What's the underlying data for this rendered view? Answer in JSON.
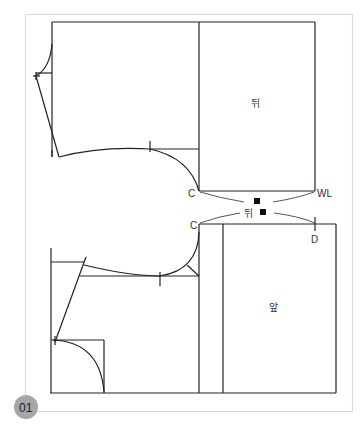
{
  "figure": {
    "number_badge": "01",
    "colors": {
      "frame": "#d9d9d9",
      "line": "#222222",
      "badge": "#a6a6a6",
      "marker": "#111111"
    },
    "labels": {
      "back_piece": "뒤",
      "front_piece": "앞",
      "back_center_upper": "C",
      "waist_line": "WL",
      "back_center_lower": "C",
      "point_d": "D",
      "back_between": "뒤"
    }
  }
}
